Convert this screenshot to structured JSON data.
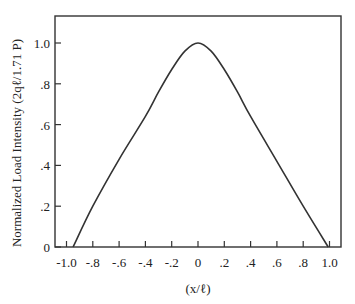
{
  "chart_data": {
    "type": "line",
    "title": "",
    "xlabel": "(x/ℓ)",
    "ylabel": "Normalized Load Intensity (2qℓ/1.71 P)",
    "xlim": [
      -1.1,
      1.1
    ],
    "ylim": [
      0,
      1.13
    ],
    "grid": false,
    "legend": null,
    "x_ticks": [
      -1.0,
      -0.8,
      -0.6,
      -0.4,
      -0.2,
      0,
      0.2,
      0.4,
      0.6,
      0.8,
      1.0
    ],
    "x_tick_labels": [
      "-1.0",
      "-.8",
      "-.6",
      "-.4",
      "-.2",
      "0",
      ".2",
      ".4",
      ".6",
      ".8",
      "1.0"
    ],
    "y_ticks": [
      0,
      0.2,
      0.4,
      0.6,
      0.8,
      1.0
    ],
    "y_tick_labels": [
      "0",
      ".2",
      ".4",
      ".6",
      ".8",
      "1.0"
    ],
    "series": [
      {
        "name": "Normalized load intensity",
        "x": [
          -0.95,
          -0.8,
          -0.6,
          -0.4,
          -0.3,
          -0.2,
          -0.1,
          0,
          0.1,
          0.2,
          0.3,
          0.4,
          0.6,
          0.8,
          0.99
        ],
        "y": [
          0,
          0.2,
          0.43,
          0.64,
          0.76,
          0.87,
          0.96,
          1.0,
          0.96,
          0.87,
          0.76,
          0.64,
          0.42,
          0.2,
          0
        ]
      }
    ]
  }
}
